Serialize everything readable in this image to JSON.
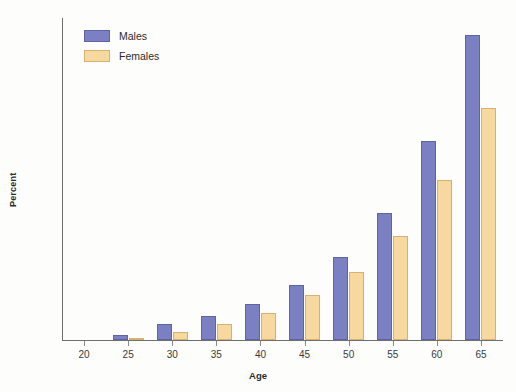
{
  "chart_data": {
    "type": "bar",
    "title": "",
    "xlabel": "Age",
    "ylabel": "Percent",
    "categories": [
      "20",
      "25",
      "30",
      "35",
      "40",
      "45",
      "50",
      "55",
      "60",
      "65"
    ],
    "series": [
      {
        "name": "Males",
        "color": "#7b80c2",
        "values": [
          0,
          0.5,
          1.5,
          2.3,
          3.5,
          5.3,
          8.0,
          12.2,
          19.2,
          29.4
        ]
      },
      {
        "name": "Females",
        "color": "#f7d9a0",
        "values": [
          0,
          0.2,
          0.8,
          1.5,
          2.6,
          4.3,
          6.5,
          10.0,
          15.4,
          22.3
        ]
      }
    ],
    "ylim": [
      0,
      31
    ],
    "yticks": [
      0,
      2,
      4,
      6,
      8,
      10,
      12,
      14,
      16,
      18,
      20,
      22,
      24,
      26,
      28,
      30
    ],
    "ytick_labels": [
      "0",
      "2",
      "4",
      "6",
      "8",
      "10",
      "12",
      "14",
      "16",
      "18",
      "20",
      "22",
      "24",
      "26",
      "28",
      "30"
    ],
    "grid": false,
    "legend_position": "top-left"
  },
  "legend": {
    "items": [
      {
        "label": "Males",
        "swatch": "male"
      },
      {
        "label": "Females",
        "swatch": "female"
      }
    ]
  }
}
